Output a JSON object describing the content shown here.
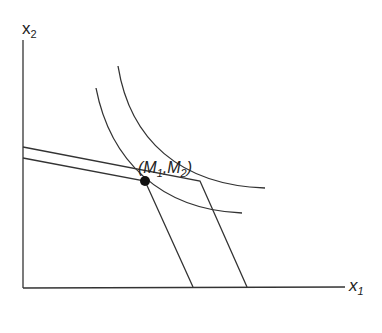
{
  "diagram": {
    "y_axis_label": "x",
    "y_axis_sub": "2",
    "x_axis_label": "x",
    "x_axis_sub": "1",
    "point_label": "(M",
    "point_sub1": "1",
    "point_mid": ",M",
    "point_sub2": "2",
    "point_end": ")",
    "line_color": "#333333"
  }
}
